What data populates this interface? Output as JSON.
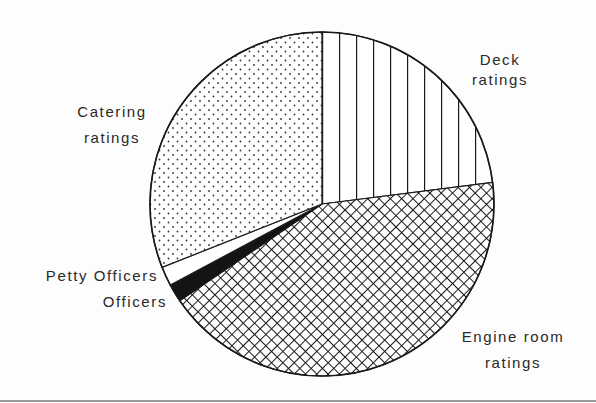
{
  "chart_data": {
    "type": "pie",
    "title": "",
    "categories": [
      "Deck ratings",
      "Engine room ratings",
      "Officers",
      "Petty Officers",
      "Catering ratings"
    ],
    "values": [
      23.0,
      42.5,
      1.7,
      1.8,
      31.0
    ],
    "units": "percent (estimated from slice angles)",
    "start_angle_deg": 90,
    "direction": "clockwise",
    "fills": {
      "Deck ratings": "vertical-lines",
      "Engine room ratings": "crosshatch",
      "Officers": "solid-black",
      "Petty Officers": "white",
      "Catering ratings": "dots"
    },
    "legend": "none (direct labels)",
    "colors": {
      "ink": "#1a1a1a",
      "background": "#ffffff"
    }
  },
  "labels": {
    "deck": {
      "line1": "Deck",
      "line2": "ratings"
    },
    "catering": {
      "line1": "Catering",
      "line2": "ratings"
    },
    "petty": {
      "line1": "Petty Officers"
    },
    "officers": {
      "line1": "Officers"
    },
    "engine": {
      "line1": "Engine room",
      "line2": "ratings"
    }
  }
}
